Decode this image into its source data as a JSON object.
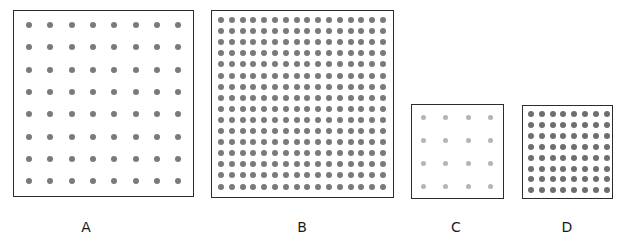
{
  "figure": {
    "panels": [
      {
        "id": "A",
        "label": "A",
        "rows": 8,
        "cols": 8,
        "dot_color": "#7a7a7a",
        "box": {
          "x": 13,
          "y": 10,
          "w": 181,
          "h": 187
        },
        "first_dot": {
          "x": 29,
          "y": 25
        },
        "spacing_x": 21.3,
        "spacing_y": 22.3,
        "dot_size": 6,
        "label_x": 86
      },
      {
        "id": "B",
        "label": "B",
        "rows": 16,
        "cols": 16,
        "dot_color": "#7a7a7a",
        "box": {
          "x": 211,
          "y": 10,
          "w": 183,
          "h": 188
        },
        "first_dot": {
          "x": 221,
          "y": 20
        },
        "spacing_x": 10.8,
        "spacing_y": 11.1,
        "dot_size": 6,
        "label_x": 302
      },
      {
        "id": "C",
        "label": "C",
        "rows": 4,
        "cols": 4,
        "dot_color": "#b4b4b4",
        "box": {
          "x": 411,
          "y": 104,
          "w": 93,
          "h": 95
        },
        "first_dot": {
          "x": 423,
          "y": 117
        },
        "spacing_x": 22.6,
        "spacing_y": 23,
        "dot_size": 5,
        "label_x": 456
      },
      {
        "id": "D",
        "label": "D",
        "rows": 8,
        "cols": 8,
        "dot_color": "#6e6e6e",
        "box": {
          "x": 522,
          "y": 105,
          "w": 91,
          "h": 94
        },
        "first_dot": {
          "x": 531,
          "y": 114
        },
        "spacing_x": 10.8,
        "spacing_y": 10.9,
        "dot_size": 6,
        "label_x": 567
      }
    ]
  }
}
